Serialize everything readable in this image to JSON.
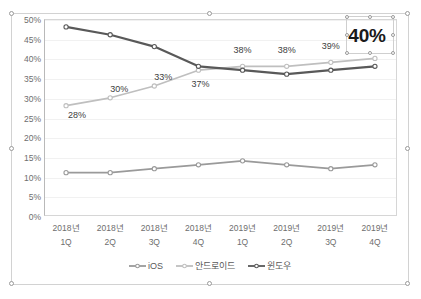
{
  "chart_data": {
    "type": "line",
    "title": "",
    "xlabel": "",
    "ylabel": "",
    "ylim": [
      0,
      0.5
    ],
    "yticks": [
      "0%",
      "5%",
      "10%",
      "15%",
      "20%",
      "25%",
      "30%",
      "35%",
      "40%",
      "45%",
      "50%"
    ],
    "grid": true,
    "legend_position": "bottom",
    "categories": [
      {
        "year": "2018년",
        "quarter": "1Q"
      },
      {
        "year": "2018년",
        "quarter": "2Q"
      },
      {
        "year": "2018년",
        "quarter": "3Q"
      },
      {
        "year": "2018년",
        "quarter": "4Q"
      },
      {
        "year": "2019년",
        "quarter": "1Q"
      },
      {
        "year": "2019년",
        "quarter": "2Q"
      },
      {
        "year": "2019년",
        "quarter": "3Q"
      },
      {
        "year": "2019년",
        "quarter": "4Q"
      }
    ],
    "series": [
      {
        "name": "iOS",
        "color": "#9a9a9a",
        "values": [
          11,
          11,
          12,
          13,
          14,
          13,
          12,
          13
        ],
        "labels": [
          "",
          "",
          "",
          "",
          "",
          "",
          "",
          ""
        ]
      },
      {
        "name": "안드로이드",
        "color": "#bfbfbf",
        "values": [
          28,
          30,
          33,
          37,
          38,
          38,
          39,
          40
        ],
        "labels": [
          "28%",
          "30%",
          "33%",
          "37%",
          "38%",
          "38%",
          "39%",
          "40%"
        ]
      },
      {
        "name": "윈도우",
        "color": "#595959",
        "values": [
          48,
          46,
          43,
          38,
          37,
          36,
          37,
          38
        ],
        "labels": [
          "",
          "",
          "",
          "",
          "",
          "",
          "",
          ""
        ]
      }
    ]
  },
  "labels": {
    "selected_label_value": "40%",
    "selected_label_series": "안드로이드",
    "selected_label_category": "2019년 4Q"
  },
  "legend": {
    "entries": [
      {
        "label": "iOS",
        "color": "#9a9a9a"
      },
      {
        "label": "안드로이드",
        "color": "#bfbfbf"
      },
      {
        "label": "윈도우",
        "color": "#595959"
      }
    ]
  },
  "selection": {
    "chart_selected": "true",
    "label_selected": "true",
    "handle_icon": "resize-handle-icon"
  }
}
